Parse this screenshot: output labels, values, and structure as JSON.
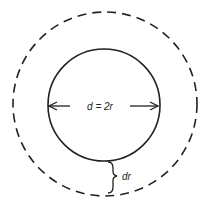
{
  "diagram": {
    "title": "",
    "labels": {
      "diameter": "d = 2r",
      "shell_thickness": "dr"
    },
    "shapes": {
      "inner_circle": {
        "cx": 104,
        "cy": 105,
        "r": 56,
        "style": "solid"
      },
      "outer_circle": {
        "cx": 105,
        "cy": 104,
        "r": 92,
        "style": "dashed"
      }
    },
    "colors": {
      "stroke": "#222222",
      "background": "#ffffff"
    }
  }
}
